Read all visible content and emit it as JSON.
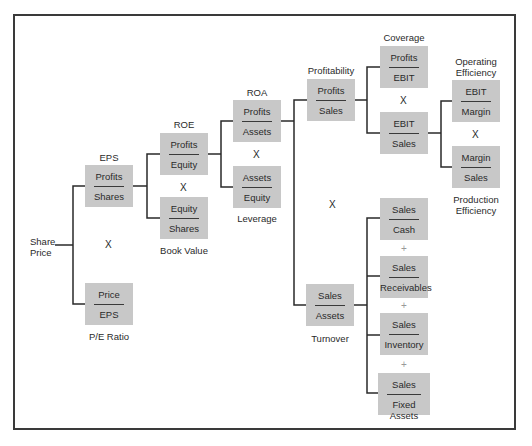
{
  "root": {
    "label_line1": "Share",
    "label_line2": "Price"
  },
  "nodes": {
    "eps": {
      "title": "EPS",
      "numerator": "Profits",
      "denominator": "Shares"
    },
    "pe": {
      "caption": "P/E Ratio",
      "numerator": "Price",
      "denominator": "EPS"
    },
    "roe": {
      "title": "ROE",
      "numerator": "Profits",
      "denominator": "Equity"
    },
    "book_value": {
      "caption": "Book Value",
      "numerator": "Equity",
      "denominator": "Shares"
    },
    "roa": {
      "title": "ROA",
      "numerator": "Profits",
      "denominator": "Assets"
    },
    "leverage": {
      "caption": "Leverage",
      "numerator": "Assets",
      "denominator": "Equity"
    },
    "profitability": {
      "title": "Profitability",
      "numerator": "Profits",
      "denominator": "Sales"
    },
    "coverage": {
      "title": "Coverage",
      "numerator": "Profits",
      "denominator": "EBIT"
    },
    "ebit_sales": {
      "numerator": "EBIT",
      "denominator": "Sales"
    },
    "operating_efficiency": {
      "title_line1": "Operating",
      "title_line2": "Efficiency",
      "numerator": "EBIT",
      "denominator": "Margin"
    },
    "production_efficiency": {
      "caption_line1": "Production",
      "caption_line2": "Efficiency",
      "numerator": "Margin",
      "denominator": "Sales"
    },
    "turnover": {
      "caption": "Turnover",
      "numerator": "Sales",
      "denominator": "Assets"
    },
    "cash": {
      "numerator": "Sales",
      "denominator": "Cash"
    },
    "receivables": {
      "numerator": "Sales",
      "denominator": "Receivables"
    },
    "inventory": {
      "numerator": "Sales",
      "denominator": "Inventory"
    },
    "fixed_assets": {
      "numerator": "Sales",
      "denominator": "Fixed Assets"
    }
  },
  "operators": {
    "multiply": "X",
    "plus": "+"
  }
}
